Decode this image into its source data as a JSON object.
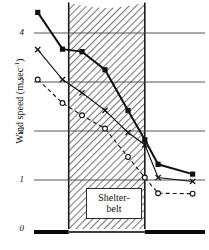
{
  "chart_data": {
    "type": "line",
    "title": "",
    "xlabel": "",
    "ylabel": "Wind speed (m sec",
    "ylabel_exponent": "-1",
    "ylabel_close": ")",
    "ylim": [
      0,
      4.6
    ],
    "xlim": [
      0,
      10
    ],
    "grid": true,
    "gridlines_y": [
      1,
      2,
      3,
      4
    ],
    "ytick_labels": [
      "0",
      "1",
      "2",
      "3",
      "4"
    ],
    "ytick_values": [
      0,
      1,
      2,
      3,
      4
    ],
    "xtick_labels": [],
    "legend_position": "none",
    "annotations": [
      {
        "name": "shelterbelt-band",
        "text_line1": "Shelter-",
        "text_line2": "belt",
        "x_start": 2.3,
        "x_end": 6.6,
        "hatch": "diagonal",
        "hatch_color": "#6e6e6e",
        "canopy_top_center": 4.52,
        "canopy_top_edges": 4.62
      }
    ],
    "series": [
      {
        "name": "upper-level",
        "marker": "filled-square",
        "linestyle": "solid",
        "color": "#111111",
        "linewidth": 2.0,
        "x": [
          0.55,
          1.95,
          3.05,
          4.35,
          5.65,
          6.6,
          7.35,
          9.3
        ],
        "y": [
          4.42,
          3.67,
          3.62,
          3.25,
          2.42,
          1.82,
          1.32,
          1.12
        ]
      },
      {
        "name": "mid-level",
        "marker": "cross",
        "linestyle": "solid",
        "color": "#111111",
        "linewidth": 1.1,
        "x": [
          0.55,
          1.95,
          3.05,
          4.35,
          5.65,
          6.6,
          7.35,
          9.3
        ],
        "y": [
          3.66,
          3.05,
          2.78,
          2.42,
          1.97,
          1.72,
          1.05,
          0.97
        ]
      },
      {
        "name": "lower-level",
        "marker": "open-circle",
        "linestyle": "dashed",
        "color": "#111111",
        "linewidth": 1.1,
        "x": [
          0.55,
          1.95,
          3.05,
          4.35,
          5.65,
          6.6,
          7.35,
          9.3
        ],
        "y": [
          3.05,
          2.57,
          2.32,
          2.05,
          1.47,
          1.05,
          0.73,
          0.72
        ]
      }
    ]
  },
  "axes": {
    "baseline_name": "ground-surface",
    "baseline_color": "#0a0a0a"
  }
}
